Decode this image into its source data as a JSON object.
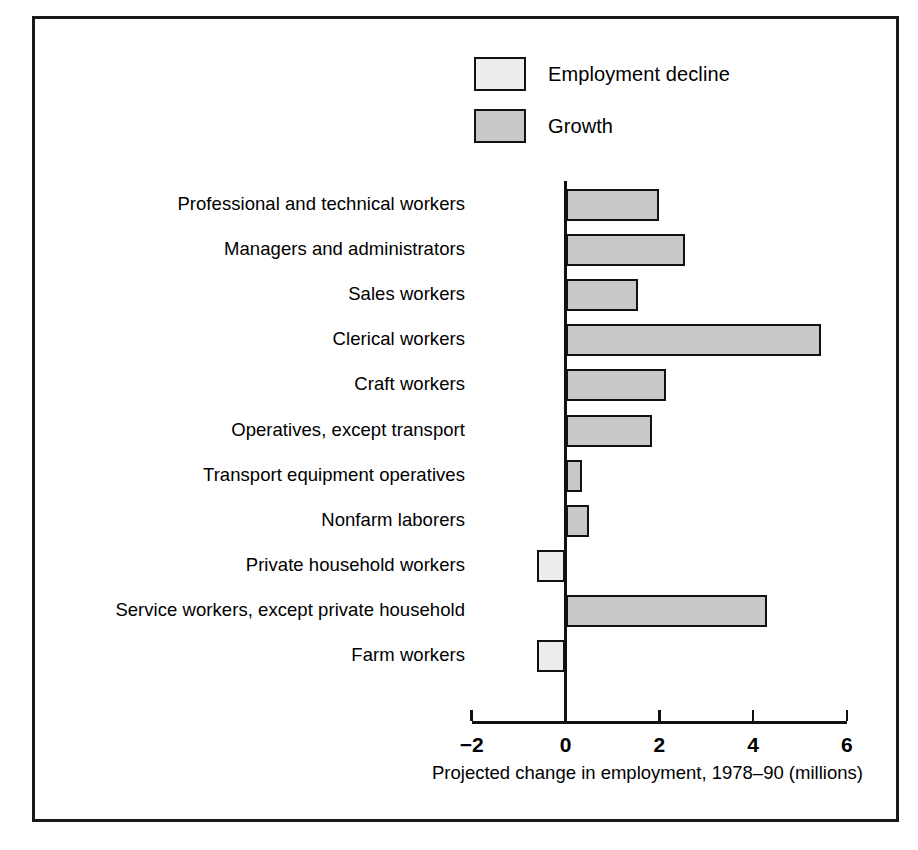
{
  "legend": {
    "items": [
      {
        "label": "Employment decline",
        "color": "#ededed",
        "key": "decline"
      },
      {
        "label": "Growth",
        "color": "#c8c8c8",
        "key": "growth"
      }
    ]
  },
  "axis": {
    "title": "Projected change in employment, 1978–90 (millions)",
    "ticks": [
      "−2",
      "0",
      "2",
      "4",
      "6"
    ]
  },
  "chart_data": {
    "type": "bar",
    "orientation": "horizontal",
    "title": "",
    "subtitle": "",
    "xlabel": "Projected change in employment, 1978–90 (millions)",
    "ylabel": "",
    "xlim": [
      -2,
      6
    ],
    "xticks": [
      -2,
      0,
      2,
      4,
      6
    ],
    "grid": false,
    "legend_position": "top-center",
    "categories": [
      "Professional and technical workers",
      "Managers and administrators",
      "Sales workers",
      "Clerical workers",
      "Craft workers",
      "Operatives, except transport",
      "Transport equipment operatives",
      "Nonfarm laborers",
      "Private household workers",
      "Service workers, except private household",
      "Farm workers"
    ],
    "values": [
      2.0,
      2.55,
      1.55,
      5.45,
      2.15,
      1.85,
      0.35,
      0.5,
      -0.6,
      4.3,
      -0.6
    ],
    "series": [
      {
        "name": "Growth",
        "color": "#c8c8c8",
        "values": [
          2.0,
          2.55,
          1.55,
          5.45,
          2.15,
          1.85,
          0.35,
          0.5,
          null,
          4.3,
          null
        ]
      },
      {
        "name": "Employment decline",
        "color": "#ededed",
        "values": [
          null,
          null,
          null,
          null,
          null,
          null,
          null,
          null,
          -0.6,
          null,
          -0.6
        ]
      }
    ]
  }
}
